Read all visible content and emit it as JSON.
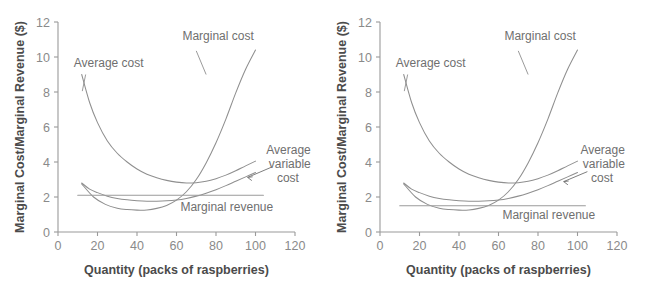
{
  "figure": {
    "background": "#ffffff",
    "curve_color": "#8f8f8f",
    "axis_color": "#9a9a9a",
    "text_color": "#6d6d6d"
  },
  "chart_data": [
    {
      "type": "line",
      "title": "",
      "panel": "left",
      "xlabel": "Quantity (packs of raspberries)",
      "ylabel": "Marginal Cost/Marginal Revenue ($)",
      "xlim": [
        0,
        120
      ],
      "ylim": [
        0,
        12
      ],
      "xticks": [
        0,
        20,
        40,
        60,
        80,
        100,
        120
      ],
      "yticks": [
        0,
        2,
        4,
        6,
        8,
        10,
        12
      ],
      "grid": false,
      "legend": "inline-annotations",
      "annotations": [
        {
          "name": "average-cost",
          "text": "Average cost",
          "x": 22,
          "y": 9.7
        },
        {
          "name": "marginal-cost",
          "text": "Marginal cost",
          "x": 72,
          "y": 11.1
        },
        {
          "name": "average-variable-cost",
          "text": "Average variable cost",
          "x": 108,
          "y": 4.3
        },
        {
          "name": "marginal-revenue",
          "text": "Marginal revenue",
          "x": 72,
          "y": 1.45
        }
      ],
      "series": [
        {
          "name": "Average cost",
          "x": [
            12,
            16,
            20,
            25,
            30,
            35,
            40,
            45,
            50,
            55,
            60,
            65,
            70,
            75,
            80,
            85,
            90,
            95,
            100
          ],
          "y": [
            9.0,
            7.4,
            6.25,
            5.2,
            4.5,
            4.0,
            3.6,
            3.3,
            3.1,
            2.95,
            2.85,
            2.8,
            2.82,
            2.9,
            3.05,
            3.25,
            3.5,
            3.78,
            4.05
          ]
        },
        {
          "name": "Average variable cost",
          "x": [
            12,
            16,
            20,
            25,
            30,
            35,
            40,
            45,
            50,
            55,
            60,
            65,
            70,
            75,
            80,
            85,
            90,
            95,
            100
          ],
          "y": [
            2.8,
            2.45,
            2.25,
            2.05,
            1.92,
            1.84,
            1.79,
            1.76,
            1.76,
            1.78,
            1.83,
            1.92,
            2.05,
            2.22,
            2.42,
            2.65,
            2.9,
            3.15,
            3.4
          ]
        },
        {
          "name": "Marginal cost",
          "x": [
            12,
            18,
            24,
            30,
            35,
            40,
            45,
            50,
            55,
            60,
            65,
            70,
            75,
            80,
            85,
            90,
            95,
            100
          ],
          "y": [
            2.75,
            2.0,
            1.58,
            1.36,
            1.28,
            1.25,
            1.26,
            1.35,
            1.52,
            1.82,
            2.3,
            3.0,
            3.95,
            5.1,
            6.45,
            7.95,
            9.3,
            10.4
          ]
        },
        {
          "name": "Marginal revenue",
          "x": [
            10,
            104
          ],
          "y": [
            2.1,
            2.1
          ]
        }
      ]
    },
    {
      "type": "line",
      "title": "",
      "panel": "right",
      "xlabel": "Quantity (packs of raspberries)",
      "ylabel": "Marginal Cost/Marginal Revenue ($)",
      "xlim": [
        0,
        120
      ],
      "ylim": [
        0,
        12
      ],
      "xticks": [
        0,
        20,
        40,
        60,
        80,
        100,
        120
      ],
      "yticks": [
        0,
        2,
        4,
        6,
        8,
        10,
        12
      ],
      "grid": false,
      "legend": "inline-annotations",
      "annotations": [
        {
          "name": "average-cost",
          "text": "Average cost",
          "x": 22,
          "y": 9.7
        },
        {
          "name": "marginal-cost",
          "text": "Marginal cost",
          "x": 72,
          "y": 11.1
        },
        {
          "name": "average-variable-cost",
          "text": "Average variable cost",
          "x": 108,
          "y": 4.3
        },
        {
          "name": "marginal-revenue",
          "text": "Marginal revenue",
          "x": 72,
          "y": 0.85
        }
      ],
      "series": [
        {
          "name": "Average cost",
          "x": [
            12,
            16,
            20,
            25,
            30,
            35,
            40,
            45,
            50,
            55,
            60,
            65,
            70,
            75,
            80,
            85,
            90,
            95,
            100
          ],
          "y": [
            9.0,
            7.4,
            6.25,
            5.2,
            4.5,
            4.0,
            3.6,
            3.3,
            3.1,
            2.95,
            2.85,
            2.8,
            2.82,
            2.9,
            3.05,
            3.25,
            3.5,
            3.78,
            4.05
          ]
        },
        {
          "name": "Average variable cost",
          "x": [
            12,
            16,
            20,
            25,
            30,
            35,
            40,
            45,
            50,
            55,
            60,
            65,
            70,
            75,
            80,
            85,
            90,
            95,
            100
          ],
          "y": [
            2.8,
            2.45,
            2.25,
            2.05,
            1.92,
            1.84,
            1.79,
            1.76,
            1.76,
            1.78,
            1.83,
            1.92,
            2.05,
            2.22,
            2.42,
            2.65,
            2.9,
            3.15,
            3.4
          ]
        },
        {
          "name": "Marginal cost",
          "x": [
            12,
            18,
            24,
            30,
            35,
            40,
            45,
            50,
            55,
            60,
            65,
            70,
            75,
            80,
            85,
            90,
            95,
            100
          ],
          "y": [
            2.75,
            2.0,
            1.58,
            1.36,
            1.28,
            1.25,
            1.26,
            1.35,
            1.52,
            1.82,
            2.3,
            3.0,
            3.95,
            5.1,
            6.45,
            7.95,
            9.3,
            10.4
          ]
        },
        {
          "name": "Marginal revenue",
          "x": [
            10,
            104
          ],
          "y": [
            1.5,
            1.5
          ]
        }
      ]
    }
  ],
  "labels": {
    "average_cost": "Average cost",
    "marginal_cost": "Marginal cost",
    "avc_line1": "Average",
    "avc_line2": "variable",
    "avc_line3": "cost",
    "marginal_revenue": "Marginal revenue",
    "xlabel": "Quantity (packs of raspberries)",
    "ylabel": "Marginal Cost/Marginal Revenue ($)"
  }
}
